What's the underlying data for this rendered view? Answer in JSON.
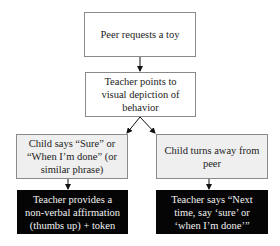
{
  "diagram": {
    "type": "flowchart",
    "nodes": [
      {
        "id": "peer_request",
        "label": "Peer requests a toy",
        "style": "white"
      },
      {
        "id": "teacher_points",
        "label": "Teacher points to visual depiction of behavior",
        "style": "white"
      },
      {
        "id": "child_says_sure",
        "label": "Child says “Sure” or “When I’m done” (or similar phrase)",
        "style": "gray"
      },
      {
        "id": "child_turns_away",
        "label": "Child turns away from peer",
        "style": "gray"
      },
      {
        "id": "teacher_affirms",
        "label": "Teacher provides a non-verbal affirmation (thumbs up) + token",
        "style": "black"
      },
      {
        "id": "teacher_prompts",
        "label": "Teacher says “Next time, say ‘sure’ or ‘when I’m done’”",
        "style": "black"
      }
    ],
    "edges": [
      {
        "from": "peer_request",
        "to": "teacher_points"
      },
      {
        "from": "teacher_points",
        "to": "child_says_sure"
      },
      {
        "from": "teacher_points",
        "to": "child_turns_away"
      },
      {
        "from": "child_says_sure",
        "to": "teacher_affirms"
      },
      {
        "from": "child_turns_away",
        "to": "teacher_prompts"
      }
    ]
  },
  "colors": {
    "box_border": "#8a8a8a",
    "box_white_fill": "#ffffff",
    "box_gray_fill": "#efefef",
    "box_black_fill": "#050505",
    "text_dark": "#222222",
    "text_light": "#f2f2f2",
    "arrow": "#111111"
  }
}
